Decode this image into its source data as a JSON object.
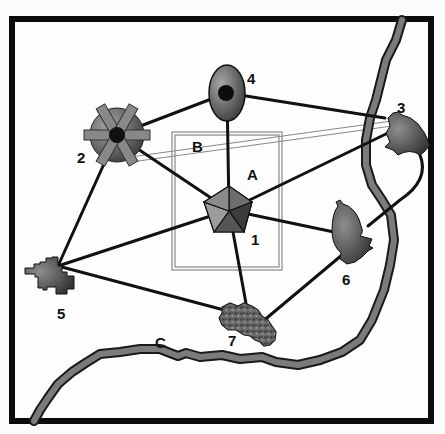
{
  "diagram": {
    "type": "network-map",
    "colors": {
      "background": "#fbfbfb",
      "frame": "#0c0c0c",
      "link": "#111111",
      "river_fill": "#7b7b7b",
      "river_edge": "#1a1a1a",
      "zone_line": "#888888",
      "node_light": "#9a9a9a",
      "node_dark": "#3a3a3a"
    },
    "nodes": [
      {
        "id": "1",
        "label": "1",
        "shape": "pentagon",
        "x": 229,
        "y": 210
      },
      {
        "id": "2",
        "label": "2",
        "shape": "gear-wheel",
        "x": 117,
        "y": 135
      },
      {
        "id": "3",
        "label": "3",
        "shape": "semicircle-blob",
        "x": 405,
        "y": 137
      },
      {
        "id": "4",
        "label": "4",
        "shape": "ellipse-with-dot",
        "x": 227,
        "y": 93
      },
      {
        "id": "5",
        "label": "5",
        "shape": "pixel-blob",
        "x": 50,
        "y": 272
      },
      {
        "id": "6",
        "label": "6",
        "shape": "amoeba-blob",
        "x": 347,
        "y": 237
      },
      {
        "id": "7",
        "label": "7",
        "shape": "textured-blob",
        "x": 248,
        "y": 325
      }
    ],
    "links": [
      {
        "from": "1",
        "to": "2"
      },
      {
        "from": "1",
        "to": "3"
      },
      {
        "from": "1",
        "to": "4"
      },
      {
        "from": "1",
        "to": "5"
      },
      {
        "from": "1",
        "to": "6"
      },
      {
        "from": "1",
        "to": "7"
      },
      {
        "from": "2",
        "to": "4"
      },
      {
        "from": "2",
        "to": "5"
      },
      {
        "from": "4",
        "to": "3"
      },
      {
        "from": "5",
        "to": "7"
      },
      {
        "from": "6",
        "to": "7"
      },
      {
        "from": "3",
        "to": "6"
      }
    ],
    "regions": [
      {
        "id": "A",
        "label": "A",
        "kind": "zone-rectangle"
      },
      {
        "id": "B",
        "label": "B",
        "kind": "corridor"
      },
      {
        "id": "C",
        "label": "C",
        "kind": "river"
      }
    ]
  }
}
